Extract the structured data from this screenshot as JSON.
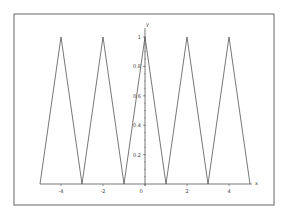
{
  "chart_data": {
    "type": "line",
    "title": "",
    "xlabel": "x",
    "ylabel": "y",
    "xlim": [
      -5,
      5
    ],
    "ylim": [
      0,
      1
    ],
    "grid": false,
    "legend": "none",
    "x_ticks": [
      -4,
      -2,
      0,
      2,
      4
    ],
    "x_tick_labels": [
      "-4",
      "-2",
      "0",
      "2",
      "4"
    ],
    "y_ticks": [
      0.2,
      0.4,
      0.6,
      0.8,
      1
    ],
    "y_tick_labels": [
      "0.2",
      "0.4",
      "0.6",
      "0.8",
      "1"
    ],
    "series": [
      {
        "name": "triangle wave",
        "color": "#555555",
        "x": [
          -5,
          -4,
          -3,
          -2,
          -1,
          0,
          1,
          2,
          3,
          4,
          5
        ],
        "y": [
          0,
          1,
          0,
          1,
          0,
          1,
          0,
          1,
          0,
          1,
          0
        ]
      }
    ]
  }
}
